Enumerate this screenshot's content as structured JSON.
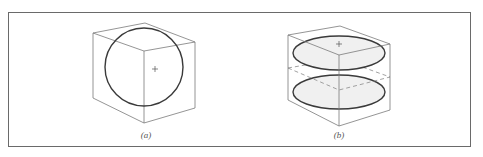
{
  "figure": {
    "panels": [
      {
        "id": "a",
        "caption": "(a)",
        "description": "Cube in isometric view with inscribed circle (sphere outline) and center cross",
        "caption_pos": {
          "x": 146,
          "y": 131
        }
      },
      {
        "id": "b",
        "caption": "(b)",
        "description": "Cube with two shaded ellipses (top and middle sections) and dashed mid-plane",
        "caption_pos": {
          "x": 339,
          "y": 131
        }
      }
    ],
    "colors": {
      "frame": "#6a6a6a",
      "thin_line": "#7a7a7a",
      "thick_line": "#3a3a3a",
      "ellipse_fill": "#f0f0f0",
      "dashed": "#8a8a8a"
    }
  }
}
